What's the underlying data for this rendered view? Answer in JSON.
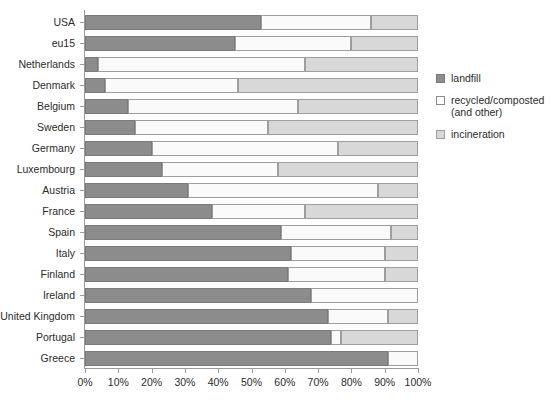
{
  "chart_data": {
    "type": "bar",
    "orientation": "horizontal",
    "stacked": true,
    "title": "",
    "subtitle": "",
    "xlabel": "",
    "ylabel": "",
    "xlim": [
      0,
      100
    ],
    "grid": false,
    "legend_position": "right",
    "x_tick_labels": [
      "0%",
      "10%",
      "20%",
      "30%",
      "40%",
      "50%",
      "60%",
      "70%",
      "80%",
      "90%",
      "100%"
    ],
    "x_tick_values": [
      0,
      10,
      20,
      30,
      40,
      50,
      60,
      70,
      80,
      90,
      100
    ],
    "categories": [
      "USA",
      "eu15",
      "Netherlands",
      "Denmark",
      "Belgium",
      "Sweden",
      "Germany",
      "Luxembourg",
      "Austria",
      "France",
      "Spain",
      "Italy",
      "Finland",
      "Ireland",
      "United Kingdom",
      "Portugal",
      "Greece"
    ],
    "series": [
      {
        "name": "landfill",
        "color": "#8c8c8c",
        "values": [
          53,
          45,
          4,
          6,
          13,
          15,
          20,
          23,
          31,
          38,
          59,
          62,
          61,
          68,
          73,
          74,
          91
        ]
      },
      {
        "name": "recycled/composted (and other)",
        "color": "#fafafa",
        "values": [
          33,
          35,
          62,
          40,
          51,
          40,
          56,
          35,
          57,
          28,
          33,
          28,
          29,
          32,
          18,
          3,
          9
        ]
      },
      {
        "name": "incineration",
        "color": "#d8d8d8",
        "values": [
          14,
          20,
          34,
          54,
          36,
          45,
          24,
          42,
          12,
          34,
          8,
          10,
          10,
          0,
          9,
          23,
          0
        ]
      }
    ],
    "legend_entries": [
      "landfill",
      "recycled/composted\n(and other)",
      "incineration"
    ]
  }
}
